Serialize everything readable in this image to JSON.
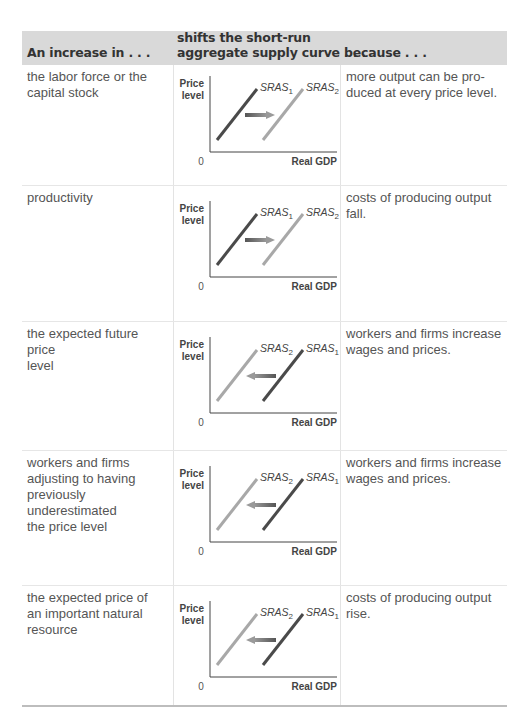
{
  "table": {
    "headers": [
      "An increase in . . .",
      "shifts the short-run",
      "aggregate supply curve . . .",
      "because . . ."
    ],
    "rows": [
      {
        "cause": [
          "the labor force or the",
          "capital stock"
        ],
        "reason": [
          "more output can be pro-",
          "duced at every price level."
        ],
        "shift": "right"
      },
      {
        "cause": [
          "productivity"
        ],
        "reason": [
          "costs of producing output",
          "fall."
        ],
        "shift": "right"
      },
      {
        "cause": [
          "the expected future price",
          "level"
        ],
        "reason": [
          "workers and firms increase",
          "wages and prices."
        ],
        "shift": "left"
      },
      {
        "cause": [
          "workers and firms",
          "adjusting to having",
          "previously underestimated",
          "the price level"
        ],
        "reason": [
          "workers and firms increase",
          "wages and prices."
        ],
        "shift": "left"
      },
      {
        "cause": [
          "the expected price of",
          "an important natural",
          "resource"
        ],
        "reason": [
          "costs of producing output",
          "rise."
        ],
        "shift": "left"
      }
    ]
  },
  "chart_labels": {
    "ylabel_line1": "Price",
    "ylabel_line2": "level",
    "xlabel": "Real GDP",
    "origin": "0",
    "curve_base": "SRAS",
    "sub1": "1",
    "sub2": "2"
  },
  "colors": {
    "header_bg": "#d9d9d9",
    "original_curve": "#4a4a4a",
    "new_curve": "#a8a8a8",
    "arrow": "#6e6e6e"
  },
  "chart_data": [
    {
      "type": "line",
      "title": "Increase in labor force or capital stock",
      "xlabel": "Real GDP",
      "ylabel": "Price level",
      "series": [
        {
          "name": "SRAS1",
          "x": [
            0.05,
            0.35
          ],
          "y": [
            0.15,
            0.85
          ]
        },
        {
          "name": "SRAS2",
          "x": [
            0.45,
            0.75
          ],
          "y": [
            0.15,
            0.85
          ]
        }
      ],
      "annotations": [
        "arrow right from SRAS1 to SRAS2"
      ],
      "grid": false
    },
    {
      "type": "line",
      "title": "Increase in productivity",
      "xlabel": "Real GDP",
      "ylabel": "Price level",
      "series": [
        {
          "name": "SRAS1",
          "x": [
            0.05,
            0.35
          ],
          "y": [
            0.15,
            0.85
          ]
        },
        {
          "name": "SRAS2",
          "x": [
            0.45,
            0.75
          ],
          "y": [
            0.15,
            0.85
          ]
        }
      ],
      "annotations": [
        "arrow right from SRAS1 to SRAS2"
      ],
      "grid": false
    },
    {
      "type": "line",
      "title": "Increase in expected future price level",
      "xlabel": "Real GDP",
      "ylabel": "Price level",
      "series": [
        {
          "name": "SRAS2",
          "x": [
            0.05,
            0.35
          ],
          "y": [
            0.15,
            0.85
          ]
        },
        {
          "name": "SRAS1",
          "x": [
            0.45,
            0.75
          ],
          "y": [
            0.15,
            0.85
          ]
        }
      ],
      "annotations": [
        "arrow left from SRAS1 to SRAS2"
      ],
      "grid": false
    },
    {
      "type": "line",
      "title": "Workers and firms adjusting to underestimated price level",
      "xlabel": "Real GDP",
      "ylabel": "Price level",
      "series": [
        {
          "name": "SRAS2",
          "x": [
            0.05,
            0.35
          ],
          "y": [
            0.15,
            0.85
          ]
        },
        {
          "name": "SRAS1",
          "x": [
            0.45,
            0.75
          ],
          "y": [
            0.15,
            0.85
          ]
        }
      ],
      "annotations": [
        "arrow left from SRAS1 to SRAS2"
      ],
      "grid": false
    },
    {
      "type": "line",
      "title": "Increase in expected price of important natural resource",
      "xlabel": "Real GDP",
      "ylabel": "Price level",
      "series": [
        {
          "name": "SRAS2",
          "x": [
            0.05,
            0.35
          ],
          "y": [
            0.15,
            0.85
          ]
        },
        {
          "name": "SRAS1",
          "x": [
            0.45,
            0.75
          ],
          "y": [
            0.15,
            0.85
          ]
        }
      ],
      "annotations": [
        "arrow left from SRAS1 to SRAS2"
      ],
      "grid": false
    }
  ]
}
